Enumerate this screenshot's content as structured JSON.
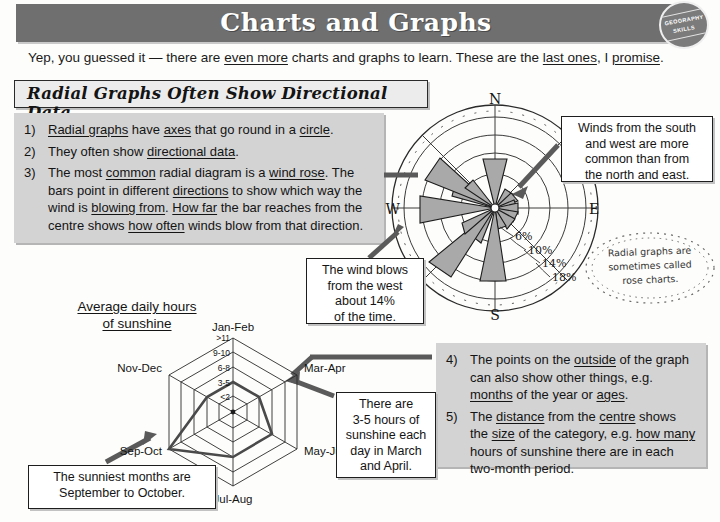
{
  "header": {
    "title": "Charts and Graphs",
    "badge_line1": "GEOGRAPHY",
    "badge_line2": "SKILLS",
    "band_color": "#6f6f6f"
  },
  "intro": {
    "text_1": "Yep, you guessed it — there are ",
    "emph_1": "even more",
    "text_2": " charts and graphs to learn.  These are the ",
    "emph_2": "last ones",
    "text_3": ", I ",
    "emph_3": "promise",
    "text_4": "."
  },
  "section": {
    "heading": "Radial Graphs Often Show Directional Data"
  },
  "points_top": [
    {
      "num": "1)",
      "parts": [
        {
          "t": "Radial graphs",
          "u": true
        },
        {
          "t": " have ",
          "u": false
        },
        {
          "t": "axes",
          "u": true
        },
        {
          "t": " that go round in a ",
          "u": false
        },
        {
          "t": "circle",
          "u": true
        },
        {
          "t": ".",
          "u": false
        }
      ]
    },
    {
      "num": "2)",
      "parts": [
        {
          "t": "They often show ",
          "u": false
        },
        {
          "t": "directional data",
          "u": true
        },
        {
          "t": ".",
          "u": false
        }
      ]
    },
    {
      "num": "3)",
      "parts": [
        {
          "t": "The most ",
          "u": false
        },
        {
          "t": "common",
          "u": true
        },
        {
          "t": " radial diagram is a ",
          "u": false
        },
        {
          "t": "wind rose",
          "u": true
        },
        {
          "t": ". The bars point in different ",
          "u": false
        },
        {
          "t": "directions",
          "u": true
        },
        {
          "t": " to show which way the wind is ",
          "u": false
        },
        {
          "t": "blowing from",
          "u": true
        },
        {
          "t": ". ",
          "u": false
        },
        {
          "t": "How far",
          "u": true
        },
        {
          "t": " the bar reaches from the centre shows ",
          "u": false
        },
        {
          "t": "how often",
          "u": true
        },
        {
          "t": " winds blow from that direction.",
          "u": false
        }
      ]
    }
  ],
  "points_bottom": [
    {
      "num": "4)",
      "parts": [
        {
          "t": "The points on the ",
          "u": false
        },
        {
          "t": "outside",
          "u": true
        },
        {
          "t": " of the graph can also show other things, e.g. ",
          "u": false
        },
        {
          "t": "months",
          "u": true
        },
        {
          "t": " of the year or ",
          "u": false
        },
        {
          "t": "ages",
          "u": true
        },
        {
          "t": ".",
          "u": false
        }
      ]
    },
    {
      "num": "5)",
      "parts": [
        {
          "t": "The ",
          "u": false
        },
        {
          "t": "distance",
          "u": true
        },
        {
          "t": " from the ",
          "u": false
        },
        {
          "t": "centre",
          "u": true
        },
        {
          "t": " shows the ",
          "u": false
        },
        {
          "t": "size",
          "u": true
        },
        {
          "t": " of the category, e.g. ",
          "u": false
        },
        {
          "t": "how many",
          "u": true
        },
        {
          "t": " hours of sunshine there are in each two-month period.",
          "u": false
        }
      ]
    }
  ],
  "callouts": {
    "winds": [
      "Winds from the south",
      "and west are more",
      "common than from",
      "the north and east."
    ],
    "west": [
      "The wind blows",
      "from the west",
      "about 14%",
      "of the time."
    ],
    "march": [
      "There are",
      "3-5 hours of",
      "sunshine each",
      "day in March",
      "and April."
    ],
    "sunniest": [
      "The sunniest months are",
      "September to October."
    ]
  },
  "rose_note": {
    "lines": [
      "Radial graphs are",
      "sometimes called",
      "rose charts."
    ]
  },
  "sunshine_title": {
    "line1": "Average daily hours",
    "line2": "of sunshine"
  },
  "chart_data": [
    {
      "type": "bar",
      "subtype": "wind-rose",
      "title": "",
      "center": {
        "x": 495,
        "y": 208
      },
      "compass_labels": [
        "N",
        "E",
        "S",
        "W"
      ],
      "rings": [
        {
          "label": "6%",
          "value": 6,
          "r": 34
        },
        {
          "label": "10%",
          "value": 10,
          "r": 55
        },
        {
          "label": "14%",
          "value": 14,
          "r": 73
        },
        {
          "label": "18%",
          "value": 18,
          "r": 91
        }
      ],
      "ylabel": "Frequency (%)",
      "xlabel": "Wind direction (from)",
      "grid": true,
      "legend": "none",
      "categories": [
        "N",
        "NNE",
        "NE",
        "ENE",
        "E",
        "ESE",
        "SE",
        "SSE",
        "S",
        "SSW",
        "SW",
        "WSW",
        "W",
        "WNW",
        "NW",
        "NNW"
      ],
      "values": [
        9,
        3,
        2.5,
        2,
        2.5,
        3.5,
        4.5,
        3,
        14,
        5,
        16,
        6,
        14,
        5.5,
        11,
        4
      ]
    },
    {
      "type": "line",
      "subtype": "radar",
      "title": "Average daily hours of sunshine",
      "center": {
        "x": 233,
        "y": 412
      },
      "categories": [
        "Jan-Feb",
        "Mar-Apr",
        "May-Jun",
        "Jul-Aug",
        "Sep-Oct",
        "Nov-Dec"
      ],
      "tick_labels": [
        "<2",
        "3-5",
        "6-8",
        "9-10",
        ">11"
      ],
      "values": [
        2,
        2,
        3,
        3,
        5,
        2
      ],
      "xlabel": "Two-month period",
      "ylabel": "Hours of sunshine per day",
      "grid": true,
      "legend": "none",
      "ylim": [
        1,
        5
      ]
    }
  ]
}
